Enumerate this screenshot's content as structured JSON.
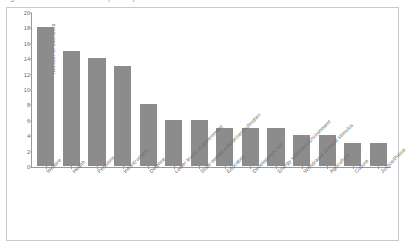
{
  "caption": {
    "text": "Figure 2.1. Fiscal consolidation plans by area — OECD countries"
  },
  "chart_data": {
    "type": "bar",
    "title": "",
    "xlabel": "",
    "ylabel": "Number of countries",
    "ylim": [
      0,
      20
    ],
    "yticks": [
      0,
      2,
      4,
      6,
      8,
      10,
      12,
      14,
      16,
      18,
      20
    ],
    "grid": false,
    "legend": "none",
    "bar_color": "#8c8c8c",
    "categories": [
      "Welfare",
      "Health",
      "Pensions",
      "Infrastructure",
      "Defence",
      "Lower levels of government",
      "State-owned enterprises/subsidies",
      "Education",
      "Development aid",
      "Energy subsidies/Environment",
      "Withdrawal of fiscal stimulus",
      "Agriculture",
      "Culture",
      "Justice/Police"
    ],
    "values": [
      18,
      15,
      14,
      13,
      8,
      6,
      6,
      5,
      5,
      5,
      4,
      4,
      3,
      3
    ]
  }
}
